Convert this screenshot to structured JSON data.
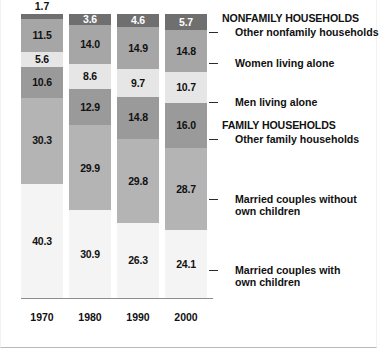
{
  "chart_data": {
    "type": "bar",
    "title": "",
    "subtitle": "",
    "xlabel": "",
    "ylabel": "",
    "stacked": true,
    "percent_stacked": true,
    "grid": false,
    "legend_position": "right",
    "ylim": [
      0,
      100
    ],
    "categories": [
      "1970",
      "1980",
      "1990",
      "2000"
    ],
    "series": [
      {
        "name": "Other nonfamily households",
        "group": "NONFAMILY HOUSEHOLDS",
        "color": "#6f6f6f",
        "values": [
          1.7,
          3.6,
          4.6,
          5.7
        ]
      },
      {
        "name": "Women living alone",
        "group": "NONFAMILY HOUSEHOLDS",
        "color": "#a6a6a6",
        "values": [
          11.5,
          14.0,
          14.9,
          14.8
        ]
      },
      {
        "name": "Men living alone",
        "group": "NONFAMILY HOUSEHOLDS",
        "color": "#e6e6e6",
        "values": [
          5.6,
          8.6,
          9.7,
          10.7
        ]
      },
      {
        "name": "Other family households",
        "group": "FAMILY HOUSEHOLDS",
        "color": "#9a9a9a",
        "values": [
          10.6,
          12.9,
          14.8,
          16.0
        ]
      },
      {
        "name": "Married couples without own children",
        "group": "FAMILY HOUSEHOLDS",
        "color": "#b4b4b4",
        "values": [
          30.3,
          29.9,
          29.8,
          28.7
        ]
      },
      {
        "name": "Married couples with own children",
        "group": "FAMILY HOUSEHOLDS",
        "color": "#f4f4f4",
        "values": [
          40.3,
          30.9,
          26.3,
          24.1
        ]
      }
    ]
  },
  "columns": [
    {
      "year": "1970",
      "top_value_outside": "1.7",
      "segments": [
        {
          "label": "1.7",
          "value": 1.7
        },
        {
          "label": "11.5",
          "value": 11.5
        },
        {
          "label": "5.6",
          "value": 5.6
        },
        {
          "label": "10.6",
          "value": 10.6
        },
        {
          "label": "30.3",
          "value": 30.3
        },
        {
          "label": "40.3",
          "value": 40.3
        }
      ]
    },
    {
      "year": "1980",
      "top_value_outside": "",
      "segments": [
        {
          "label": "3.6",
          "value": 3.6
        },
        {
          "label": "14.0",
          "value": 14.0
        },
        {
          "label": "8.6",
          "value": 8.6
        },
        {
          "label": "12.9",
          "value": 12.9
        },
        {
          "label": "29.9",
          "value": 29.9
        },
        {
          "label": "30.9",
          "value": 30.9
        }
      ]
    },
    {
      "year": "1990",
      "top_value_outside": "",
      "segments": [
        {
          "label": "4.6",
          "value": 4.6
        },
        {
          "label": "14.9",
          "value": 14.9
        },
        {
          "label": "9.7",
          "value": 9.7
        },
        {
          "label": "14.8",
          "value": 14.8
        },
        {
          "label": "29.8",
          "value": 29.8
        },
        {
          "label": "26.3",
          "value": 26.3
        }
      ]
    },
    {
      "year": "2000",
      "top_value_outside": "",
      "segments": [
        {
          "label": "5.7",
          "value": 5.7
        },
        {
          "label": "14.8",
          "value": 14.8
        },
        {
          "label": "10.7",
          "value": 10.7
        },
        {
          "label": "16.0",
          "value": 16.0
        },
        {
          "label": "28.7",
          "value": 28.7
        },
        {
          "label": "24.1",
          "value": 24.1
        }
      ]
    }
  ],
  "legend": {
    "entries": [
      {
        "text": "NONFAMILY HOUSEHOLDS",
        "type": "header",
        "top": 0,
        "leader": false
      },
      {
        "text": "Other nonfamily households",
        "type": "item",
        "top": 14,
        "leader": true
      },
      {
        "text": "Women living alone",
        "type": "item",
        "top": 45,
        "leader": true
      },
      {
        "text": "Men living alone",
        "type": "item",
        "top": 84,
        "leader": true
      },
      {
        "text": "FAMILY HOUSEHOLDS",
        "type": "header",
        "top": 107,
        "leader": false
      },
      {
        "text": "Other family households",
        "type": "item",
        "top": 121,
        "leader": true
      },
      {
        "text": "Married couples without",
        "type": "item",
        "top": 181,
        "leader": true
      },
      {
        "text": "own children",
        "type": "cont",
        "top": 193,
        "leader": false
      },
      {
        "text": "Married couples with",
        "type": "item",
        "top": 252,
        "leader": true
      },
      {
        "text": "own children",
        "type": "cont",
        "top": 264,
        "leader": false
      }
    ]
  }
}
